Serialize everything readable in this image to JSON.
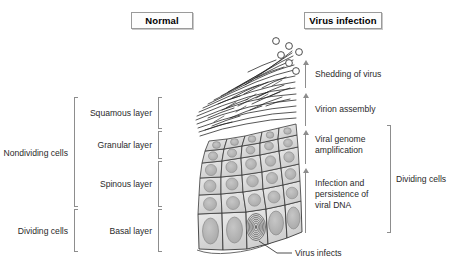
{
  "diagram": {
    "title_normal": "Normal",
    "title_virus": "Virus infection",
    "side_left_top": "Nondividing cells",
    "side_left_bottom": "Dividing cells",
    "side_right": "Dividing cells",
    "layers": [
      {
        "label": "Squamous layer"
      },
      {
        "label": "Granular layer"
      },
      {
        "label": "Spinous layer"
      },
      {
        "label": "Basal layer"
      }
    ],
    "stages": [
      {
        "label": "Shedding of virus"
      },
      {
        "label": "Virion assembly"
      },
      {
        "label": "Viral genome"
      },
      {
        "label": "amplification"
      },
      {
        "label": "Infection and"
      },
      {
        "label": "persistence of"
      },
      {
        "label": "viral DNA"
      }
    ],
    "callout": "Virus infects",
    "colors": {
      "cell_fill": "#dcdcdc",
      "cell_stroke": "#3a3a3a",
      "nucleus_fill": "#b4b4b4",
      "nucleus_stroke": "#8a8a8a",
      "bracket": "#8d8d8d",
      "arrow": "#8d8d8d",
      "text": "#2a2a2a",
      "background": "#ffffff"
    }
  }
}
